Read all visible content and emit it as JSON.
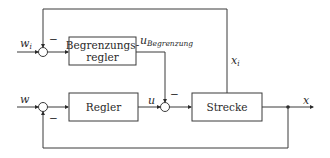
{
  "diagram": {
    "type": "block-diagram",
    "blocks": {
      "limiter": {
        "line1": "Begrenzungs-",
        "line2": "regler"
      },
      "controller": {
        "label": "Regler"
      },
      "plant": {
        "label": "Strecke"
      }
    },
    "signals": {
      "wi_main": "w",
      "wi_sub": "i",
      "w": "w",
      "u": "u",
      "u_limit_main": "u",
      "u_limit_sub": "Begrenzung",
      "xi_main": "x",
      "xi_sub": "i",
      "x": "x"
    },
    "signs": {
      "upper_junction_feedback": "−",
      "lower_junction_feedback": "−",
      "u_junction_limit": "−"
    }
  }
}
